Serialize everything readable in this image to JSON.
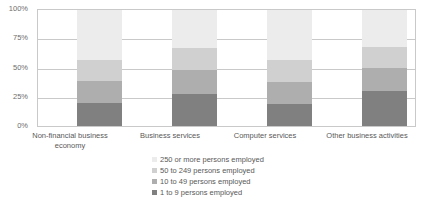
{
  "chart": {
    "title": "",
    "yticks": [
      "100%",
      "75%",
      "50%",
      "25%",
      "0%"
    ]
  },
  "legend": {
    "items": [
      {
        "label": "250 or more persons employed",
        "color": "#ececec"
      },
      {
        "label": "50 to 249 persons employed",
        "color": "#d0d0d0"
      },
      {
        "label": "10 to 49 persons employed",
        "color": "#aeaeae"
      },
      {
        "label": "1 to 9 persons employed",
        "color": "#808080"
      }
    ]
  },
  "chart_data": {
    "type": "bar",
    "stacked": true,
    "stack_total": 100,
    "title": "",
    "xlabel": "",
    "ylabel": "",
    "ylim": [
      0,
      100
    ],
    "yticks": [
      0,
      25,
      50,
      75,
      100
    ],
    "ytick_labels": [
      "0%",
      "25%",
      "50%",
      "75%",
      "100%"
    ],
    "grid": true,
    "legend_position": "bottom",
    "categories": [
      "Non-financial business\neconomy",
      "Business services",
      "Computer services",
      "Other business activities"
    ],
    "category_labels_flat": [
      "Non-financial business economy",
      "Business services",
      "Computer services",
      "Other business activities"
    ],
    "series": [
      {
        "name": "1 to 9 persons employed",
        "color": "#808080",
        "values": [
          20,
          28,
          19,
          30
        ]
      },
      {
        "name": "10 to 49 persons employed",
        "color": "#aeaeae",
        "values": [
          19,
          20,
          19,
          20
        ]
      },
      {
        "name": "50 to 249 persons employed",
        "color": "#d0d0d0",
        "values": [
          18,
          19,
          19,
          18
        ]
      },
      {
        "name": "250 or more persons employed",
        "color": "#ececec",
        "values": [
          43,
          33,
          43,
          32
        ]
      }
    ],
    "cumulative_tops": [
      [
        20,
        39,
        57,
        100
      ],
      [
        28,
        48,
        67,
        100
      ],
      [
        19,
        38,
        57,
        100
      ],
      [
        30,
        50,
        68,
        100
      ]
    ]
  },
  "layout": {
    "bar_x": [
      40,
      135,
      230,
      325
    ],
    "cat_label_x": [
      10,
      120,
      215,
      310
    ],
    "cat_label_w": [
      120,
      100,
      100,
      115
    ],
    "bar_width": 45
  }
}
